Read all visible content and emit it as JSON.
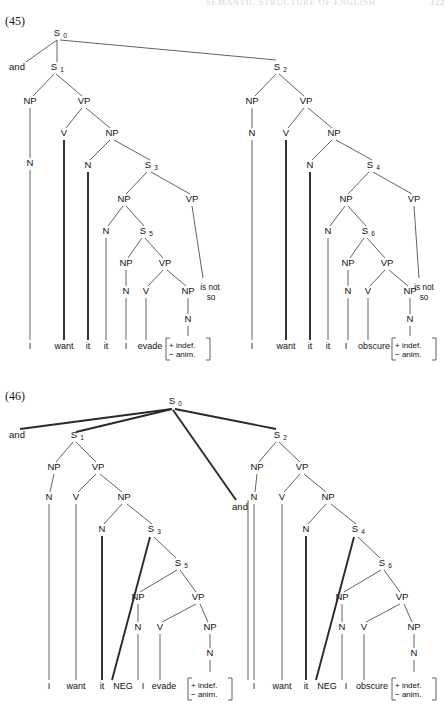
{
  "header": {
    "running_title": "SEMANTIC STRUCTURE OF ENGLISH",
    "page_number": "322"
  },
  "figures": [
    {
      "id": "fig-45",
      "label": "(45)",
      "root": "S",
      "root_sub": "0",
      "conjunction": "and",
      "clauses": [
        {
          "name": "S",
          "sub": "1",
          "nodes": [
            "NP",
            "VP",
            "N",
            "V",
            "NP",
            "N",
            "S",
            "NP",
            "VP",
            "N",
            "S",
            "NP",
            "VP",
            "N",
            "V",
            "NP",
            "N"
          ],
          "embedded": [
            "S3",
            "S5"
          ],
          "terminals": [
            "I",
            "want",
            "it",
            "it",
            "I",
            "evade"
          ],
          "feature_matrix": [
            "+ indef.",
            "− anim."
          ],
          "tail_text_line1": "is not",
          "tail_text_line2": "so"
        },
        {
          "name": "S",
          "sub": "2",
          "nodes": [
            "NP",
            "VP",
            "N",
            "V",
            "NP",
            "N",
            "S",
            "NP",
            "VP",
            "N",
            "S",
            "NP",
            "VP",
            "N",
            "V",
            "NP",
            "N"
          ],
          "embedded": [
            "S4",
            "S6"
          ],
          "terminals": [
            "I",
            "want",
            "it",
            "it",
            "I",
            "obscure"
          ],
          "feature_matrix": [
            "+ indef.",
            "− anim."
          ],
          "tail_text_line1": "is not",
          "tail_text_line2": "so"
        }
      ]
    },
    {
      "id": "fig-46",
      "label": "(46)",
      "root": "S",
      "root_sub": "0",
      "conjunction_left": "and",
      "conjunction_middle": "and",
      "clauses": [
        {
          "name": "S",
          "sub": "1",
          "embedded": [
            "S3",
            "S5"
          ],
          "terminals": [
            "I",
            "want",
            "it",
            "NEG",
            "I",
            "evade"
          ],
          "feature_matrix": [
            "+ indef.",
            "− anim."
          ]
        },
        {
          "name": "S",
          "sub": "2",
          "embedded": [
            "S4",
            "S6"
          ],
          "terminals": [
            "I",
            "want",
            "it",
            "NEG",
            "I",
            "obscure"
          ],
          "feature_matrix": [
            "+ indef.",
            "− anim."
          ]
        }
      ]
    }
  ],
  "node_labels": {
    "NP": "NP",
    "VP": "VP",
    "N": "N",
    "V": "V",
    "S": "S",
    "NEG": "NEG"
  },
  "colors": {
    "ink": "#111111",
    "line": "#3a3a3a",
    "paper": "#ffffff"
  }
}
